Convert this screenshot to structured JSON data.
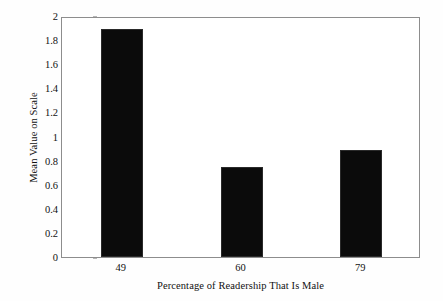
{
  "chart_data": {
    "type": "bar",
    "title": "",
    "xlabel": "Percentage of Readership That Is Male",
    "ylabel": "Mean Value on Scale",
    "categories": [
      "49",
      "60",
      "79"
    ],
    "values": [
      1.89,
      0.75,
      0.89
    ],
    "series": [
      {
        "name": "Mean Value on Scale",
        "values": [
          1.89,
          0.75,
          0.89
        ]
      }
    ],
    "ylim": [
      0,
      2
    ],
    "ytick_labels": [
      "2",
      "1.8",
      "1.6",
      "1.4",
      "1.2",
      "1",
      "0.8",
      "0.6",
      "0.4",
      "0.2",
      "0"
    ],
    "ytick_values": [
      2,
      1.8,
      1.6,
      1.4,
      1.2,
      1,
      0.8,
      0.6,
      0.4,
      0.2,
      0
    ],
    "xtick_labels": [
      "49",
      "60",
      "79"
    ],
    "grid": false,
    "legend": false,
    "legend_position": "none",
    "bar_color": "#0b0b0b",
    "axis_color": "#8d8d8d",
    "background_color": "#ffffff"
  }
}
